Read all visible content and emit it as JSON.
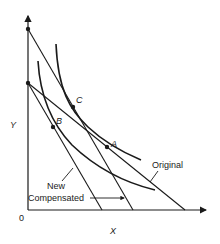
{
  "diagram": {
    "axes": {
      "y_label": "Y",
      "x_label": "X",
      "origin_label": "0"
    },
    "points": {
      "A": "A",
      "B": "B",
      "C": "C"
    },
    "line_labels": {
      "original": "Original",
      "new": "New",
      "compensated": "Compensated"
    },
    "colors": {
      "ink": "#1a1a1a",
      "background": "#ffffff"
    }
  }
}
